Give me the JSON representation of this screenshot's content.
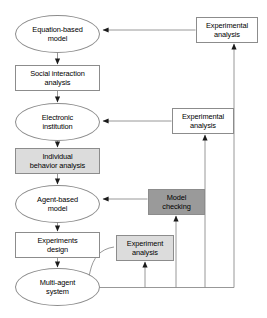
{
  "diagram": {
    "background": "#ffffff",
    "line_color": "#8c8c8c",
    "arrow_color": "#1a1a1a",
    "nodes": [
      {
        "id": "equation-based-model",
        "label": "Equation-based\nmodel",
        "shape": "ellipse",
        "fill": "#ffffff"
      },
      {
        "id": "social-interaction-analysis",
        "label": "Social interaction\nanalysis",
        "shape": "rect",
        "fill": "#ffffff"
      },
      {
        "id": "electronic-institution",
        "label": "Electronic\ninstitution",
        "shape": "ellipse",
        "fill": "#ffffff"
      },
      {
        "id": "individual-behavior-analysis",
        "label": "Individual\nbehavior analysis",
        "shape": "rect",
        "fill": "#dcdcdc"
      },
      {
        "id": "agent-based-model",
        "label": "Agent-based\nmodel",
        "shape": "ellipse",
        "fill": "#ffffff"
      },
      {
        "id": "experiments-design",
        "label": "Experiments\ndesign",
        "shape": "rect",
        "fill": "#ffffff"
      },
      {
        "id": "multi-agent-system",
        "label": "Multi-agent\nsystem",
        "shape": "ellipse",
        "fill": "#ffffff"
      },
      {
        "id": "experimental-analysis-top",
        "label": "Experimental\nanalysis",
        "shape": "rect",
        "fill": "#ffffff"
      },
      {
        "id": "experimental-analysis-mid",
        "label": "Experimental\nanalysis",
        "shape": "rect",
        "fill": "#ffffff"
      },
      {
        "id": "model-checking",
        "label": "Model\nchecking",
        "shape": "rect",
        "fill": "#9a9a9a"
      },
      {
        "id": "experiment-analysis",
        "label": "Experiment\nanalysis",
        "shape": "rect",
        "fill": "#dcdcdc"
      }
    ],
    "edges": [
      {
        "from": "equation-based-model",
        "to": "social-interaction-analysis"
      },
      {
        "from": "social-interaction-analysis",
        "to": "electronic-institution"
      },
      {
        "from": "electronic-institution",
        "to": "individual-behavior-analysis"
      },
      {
        "from": "individual-behavior-analysis",
        "to": "agent-based-model"
      },
      {
        "from": "agent-based-model",
        "to": "experiments-design"
      },
      {
        "from": "experiments-design",
        "to": "multi-agent-system"
      },
      {
        "from": "experimental-analysis-top",
        "to": "equation-based-model"
      },
      {
        "from": "experimental-analysis-mid",
        "to": "electronic-institution"
      },
      {
        "from": "model-checking",
        "to": "agent-based-model"
      },
      {
        "from": "multi-agent-system",
        "to": "experiment-analysis"
      },
      {
        "from": "multi-agent-system",
        "to": "model-checking"
      },
      {
        "from": "multi-agent-system",
        "to": "experimental-analysis-mid"
      },
      {
        "from": "multi-agent-system",
        "to": "experimental-analysis-top"
      }
    ]
  },
  "labels": {
    "equation_based_model_l1": "Equation-based",
    "equation_based_model_l2": "model",
    "social_interaction_l1": "Social interaction",
    "social_interaction_l2": "analysis",
    "electronic_institution_l1": "Electronic",
    "electronic_institution_l2": "institution",
    "individual_behavior_l1": "Individual",
    "individual_behavior_l2": "behavior analysis",
    "agent_based_model_l1": "Agent-based",
    "agent_based_model_l2": "model",
    "experiments_design_l1": "Experiments",
    "experiments_design_l2": "design",
    "multi_agent_system_l1": "Multi-agent",
    "multi_agent_system_l2": "system",
    "experimental_analysis_top_l1": "Experimental",
    "experimental_analysis_top_l2": "analysis",
    "experimental_analysis_mid_l1": "Experimental",
    "experimental_analysis_mid_l2": "analysis",
    "model_checking_l1": "Model",
    "model_checking_l2": "checking",
    "experiment_analysis_l1": "Experiment",
    "experiment_analysis_l2": "analysis"
  }
}
